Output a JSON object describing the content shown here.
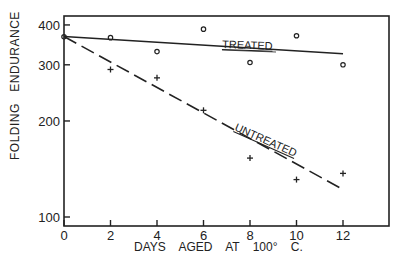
{
  "chart_data": {
    "type": "scatter",
    "title": "",
    "xlabel": "DAYS AGED AT 100° C.",
    "ylabel": "FOLDING ENDURANCE",
    "xlim": [
      0,
      14
    ],
    "ylim": [
      95,
      420
    ],
    "yscale": "log",
    "x_ticks": [
      0,
      2,
      4,
      6,
      8,
      10,
      12
    ],
    "x_tick_labels": [
      "0",
      "2",
      "4",
      "6",
      "8",
      "10",
      "12"
    ],
    "y_ticks": [
      100,
      200,
      300,
      400
    ],
    "y_tick_labels": [
      "100",
      "200",
      "300",
      "400"
    ],
    "grid": false,
    "series": [
      {
        "name": "TREATED",
        "marker": "circle",
        "line_style": "solid",
        "x": [
          0,
          2,
          4,
          6,
          8,
          10,
          12
        ],
        "values": [
          367,
          365,
          330,
          388,
          305,
          370,
          300
        ],
        "fit_line": {
          "x": [
            0,
            12
          ],
          "y": [
            368,
            325
          ]
        }
      },
      {
        "name": "UNTREATED",
        "marker": "plus",
        "line_style": "dashed",
        "x": [
          2,
          4,
          6,
          8,
          10,
          12
        ],
        "values": [
          290,
          273,
          216,
          153,
          131,
          137
        ],
        "fit_line": {
          "x": [
            0,
            12
          ],
          "y": [
            368,
            122
          ]
        }
      }
    ]
  },
  "labels": {
    "ylabel": "FOLDING   ENDURANCE",
    "xlabel": "DAYS AGED AT 100° C.",
    "treated": "TREATED",
    "untreated": "UNTREATED"
  }
}
